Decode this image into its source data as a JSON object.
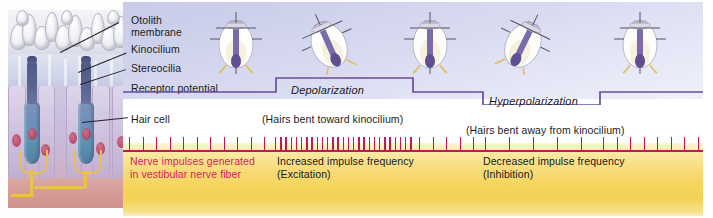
{
  "figure": {
    "colors": {
      "upper_panel": "#d0d3ec",
      "lower_panel": "#f5d45f",
      "trace_line": "#6b4c9a",
      "spike_color": "#c2185b",
      "nerve_text": "#d81b60",
      "label_text": "#1b1b22"
    }
  },
  "labels": [
    {
      "id": "otolith-membrane",
      "text": "Otolith\nmembrane"
    },
    {
      "id": "kinocilium",
      "text": "Kinocilium"
    },
    {
      "id": "stereocilia",
      "text": "Stereocilia"
    },
    {
      "id": "receptor-potential",
      "text": "Receptor potential"
    },
    {
      "id": "hair-cell",
      "text": "Hair cell"
    }
  ],
  "states": [
    {
      "id": "depolarization",
      "label": "Depolarization",
      "caption": "(Hairs bent toward kinocilium)"
    },
    {
      "id": "hyperpolarization",
      "label": "Hyperpolarization",
      "caption": "(Hairs bent away from kinocilium)"
    }
  ],
  "nerve": {
    "generated_text": "Nerve impulses generated\nin vestibular nerve fiber",
    "increased_text": "Increased impulse frequency\n(Excitation)",
    "decreased_text": "Decreased impulse frequency\n(Inhibition)"
  },
  "chart_data": {
    "type": "line",
    "title": "Receptor potential",
    "xlabel": "",
    "ylabel": "Receptor potential",
    "series": [
      {
        "name": "Receptor potential",
        "step_levels": [
          {
            "from_x": 0,
            "to_x": 153,
            "level": "resting"
          },
          {
            "from_x": 153,
            "to_x": 290,
            "level": "depolarized"
          },
          {
            "from_x": 290,
            "to_x": 360,
            "level": "resting"
          },
          {
            "from_x": 360,
            "to_x": 477,
            "level": "hyperpolarized"
          },
          {
            "from_x": 477,
            "to_x": 580,
            "level": "resting"
          }
        ]
      }
    ],
    "spike_train": {
      "baseline_rate_label": "Nerve impulses generated in vestibular nerve fiber",
      "segments": [
        {
          "region": "resting",
          "from_x": 6,
          "to_x": 150,
          "spacing": 13.5,
          "rate": "baseline"
        },
        {
          "region": "excitation",
          "from_x": 152,
          "to_x": 288,
          "spacing": 5.2,
          "rate": "increased"
        },
        {
          "region": "resting",
          "from_x": 296,
          "to_x": 356,
          "spacing": 13.5,
          "rate": "baseline"
        },
        {
          "region": "inhibition",
          "from_x": 362,
          "to_x": 474,
          "spacing": 24.0,
          "rate": "decreased"
        },
        {
          "region": "resting",
          "from_x": 480,
          "to_x": 578,
          "spacing": 13.5,
          "rate": "baseline"
        }
      ]
    },
    "annotations": [
      "Depolarization",
      "(Hairs bent toward kinocilium)",
      "Hyperpolarization",
      "(Hairs bent away from kinocilium)",
      "Increased impulse frequency (Excitation)",
      "Decreased impulse frequency (Inhibition)"
    ]
  },
  "hair_cell_icons": [
    {
      "id": "icon-resting-1",
      "tilt": 0,
      "state": "resting"
    },
    {
      "id": "icon-bent-toward",
      "tilt": -22,
      "state": "bent-toward-kinocilium"
    },
    {
      "id": "icon-resting-2",
      "tilt": 0,
      "state": "resting"
    },
    {
      "id": "icon-bent-away",
      "tilt": 22,
      "state": "bent-away-from-kinocilium"
    },
    {
      "id": "icon-resting-3",
      "tilt": 0,
      "state": "resting"
    }
  ]
}
